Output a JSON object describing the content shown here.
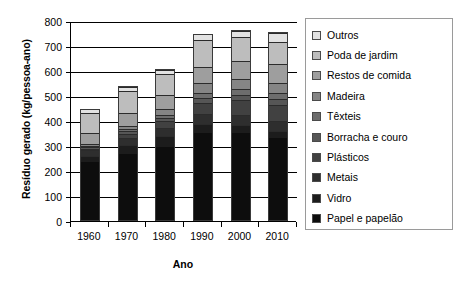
{
  "chart_data": {
    "type": "bar",
    "stacked": true,
    "title": "",
    "xlabel": "Ano",
    "ylabel": "Resíduo gerado (kg/pessoa-ano)",
    "categories": [
      "1960",
      "1970",
      "1980",
      "1990",
      "2000",
      "2010"
    ],
    "ylim": [
      0,
      800
    ],
    "yticks": [
      0,
      100,
      200,
      300,
      400,
      500,
      600,
      700,
      800
    ],
    "ytick_labels": [
      "0",
      "100",
      "200",
      "300",
      "400",
      "500",
      "600",
      "700",
      "800"
    ],
    "grid": true,
    "legend_position": "right",
    "totals": [
      450,
      540,
      610,
      750,
      765,
      755
    ],
    "series": [
      {
        "name": "Papel e papelão",
        "color": "#0d0d0d",
        "values": [
          235,
          270,
          295,
          350,
          350,
          330
        ]
      },
      {
        "name": "Vidro",
        "color": "#1c1c1c",
        "values": [
          25,
          35,
          45,
          40,
          35,
          30
        ]
      },
      {
        "name": "Metais",
        "color": "#2e2e2e",
        "values": [
          25,
          30,
          35,
          40,
          40,
          40
        ]
      },
      {
        "name": "Plásticos",
        "color": "#414141",
        "values": [
          5,
          15,
          25,
          45,
          60,
          65
        ]
      },
      {
        "name": "Borracha e couro",
        "color": "#565656",
        "values": [
          7,
          10,
          13,
          20,
          22,
          24
        ]
      },
      {
        "name": "Têxteis",
        "color": "#6d6d6d",
        "values": [
          6,
          9,
          12,
          18,
          22,
          26
        ]
      },
      {
        "name": "Madeira",
        "color": "#858585",
        "values": [
          7,
          14,
          25,
          40,
          42,
          40
        ]
      },
      {
        "name": "Restos de comida",
        "color": "#9e9e9e",
        "values": [
          45,
          50,
          55,
          65,
          72,
          75
        ]
      },
      {
        "name": "Poda de jardim",
        "color": "#bdbdbd",
        "values": [
          80,
          90,
          85,
          110,
          95,
          90
        ]
      },
      {
        "name": "Outros",
        "color": "#e2e2e2",
        "values": [
          15,
          17,
          20,
          22,
          27,
          35
        ]
      }
    ]
  },
  "legend": {
    "items": [
      {
        "label": "Outros",
        "color": "#e2e2e2"
      },
      {
        "label": "Poda de jardim",
        "color": "#bdbdbd"
      },
      {
        "label": "Restos de comida",
        "color": "#9e9e9e"
      },
      {
        "label": "Madeira",
        "color": "#858585"
      },
      {
        "label": "Têxteis",
        "color": "#6d6d6d"
      },
      {
        "label": "Borracha e couro",
        "color": "#565656"
      },
      {
        "label": "Plásticos",
        "color": "#414141"
      },
      {
        "label": "Metais",
        "color": "#2e2e2e"
      },
      {
        "label": "Vidro",
        "color": "#1c1c1c"
      },
      {
        "label": "Papel e papelão",
        "color": "#0d0d0d"
      }
    ]
  }
}
